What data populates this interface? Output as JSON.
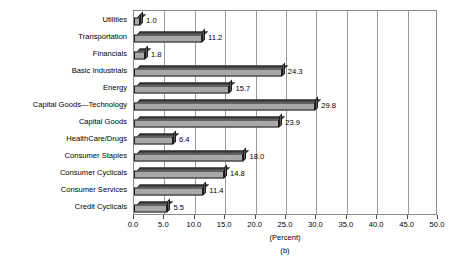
{
  "chart_data": {
    "type": "bar",
    "orientation": "horizontal",
    "title": "",
    "subtitle": "",
    "caption": "(b)",
    "xlabel": "(Percent)",
    "ylabel": "",
    "xlim": [
      0.0,
      50.0
    ],
    "xticks": [
      "0.0",
      "5.0",
      "10.0",
      "15.0",
      "20.0",
      "25.0",
      "30.0",
      "35.0",
      "40.0",
      "45.0",
      "50.0"
    ],
    "xtick_values": [
      0.0,
      5.0,
      10.0,
      15.0,
      20.0,
      25.0,
      30.0,
      35.0,
      40.0,
      45.0,
      50.0
    ],
    "grid": "vertical",
    "legend": "none",
    "categories": [
      "Utilities",
      "Transportation",
      "Financials",
      "Basic Industrials",
      "Energy",
      "Capital Goods—Technology",
      "Capital Goods",
      "HealthCare/Drugs",
      "Consumer Staples",
      "Consumer Cyclicals",
      "Consumer Services",
      "Credit Cyclicals"
    ],
    "values": [
      1.0,
      11.2,
      1.8,
      24.3,
      15.7,
      29.8,
      23.9,
      6.4,
      18.0,
      14.8,
      11.4,
      5.5
    ],
    "value_labels": [
      "1.0",
      "11.2",
      "1.8",
      "24.3",
      "15.7",
      "29.8",
      "23.9",
      "6.4",
      "18.0",
      "14.8",
      "11.4",
      "5.5"
    ],
    "bar_face_color": "#a8a8a8",
    "bar_top_color": "#4a4a4a",
    "bar_side_color": "#5e5e5e",
    "bar_outline_color": "#1c1c1c",
    "grid_color": "#9a9a9a",
    "frame_color": "#8c8c8c",
    "background_color": "#ffffff",
    "text_color": "#000000"
  }
}
